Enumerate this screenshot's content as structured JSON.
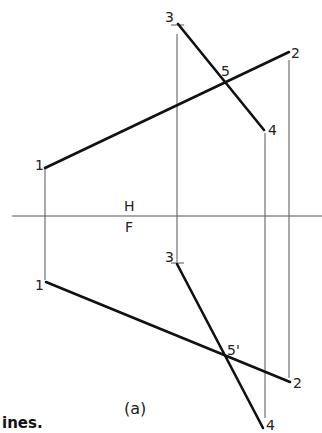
{
  "figure": {
    "fold_line": {
      "upper_label": "H",
      "lower_label": "F"
    },
    "top_view": {
      "points": {
        "p1": "1",
        "p2": "2",
        "p3": "3",
        "p4": "4",
        "p5": "5"
      }
    },
    "front_view": {
      "points": {
        "p1": "1",
        "p2": "2",
        "p3": "3",
        "p4": "4",
        "p5": "5'"
      }
    },
    "sublabel": "(a)",
    "caption_fragment": "ines."
  }
}
